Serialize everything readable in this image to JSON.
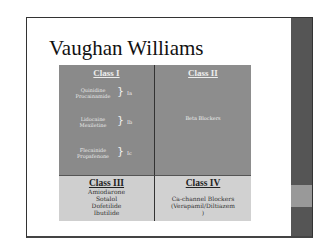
{
  "slide": {
    "title": "Vaughan Williams",
    "table": {
      "class1": {
        "header": "Class I",
        "groups": [
          {
            "drugs": [
              "Quinidine",
              "Procainamide"
            ],
            "subclass": "Ia"
          },
          {
            "drugs": [
              "Lidocaine",
              "Mexiletine"
            ],
            "subclass": "Ib"
          },
          {
            "drugs": [
              "Flecainide",
              "Propafenone"
            ],
            "subclass": "Ic"
          }
        ]
      },
      "class2": {
        "header": "Class II",
        "drugs": "Beta Blockers"
      },
      "class3": {
        "header": "Class III",
        "drugs": [
          "Amiodarone",
          "Sotalol",
          "Dofetilide",
          "Ibutilide"
        ]
      },
      "class4": {
        "header": "Class IV",
        "line1": "Ca-channel Blockers",
        "line2": "(Verapamil/Diltiazem",
        "line3": ")"
      }
    }
  },
  "colors": {
    "dark_cell": "#8a8a8a",
    "light_cell": "#cfcfcf",
    "sidebar": "#555555"
  }
}
